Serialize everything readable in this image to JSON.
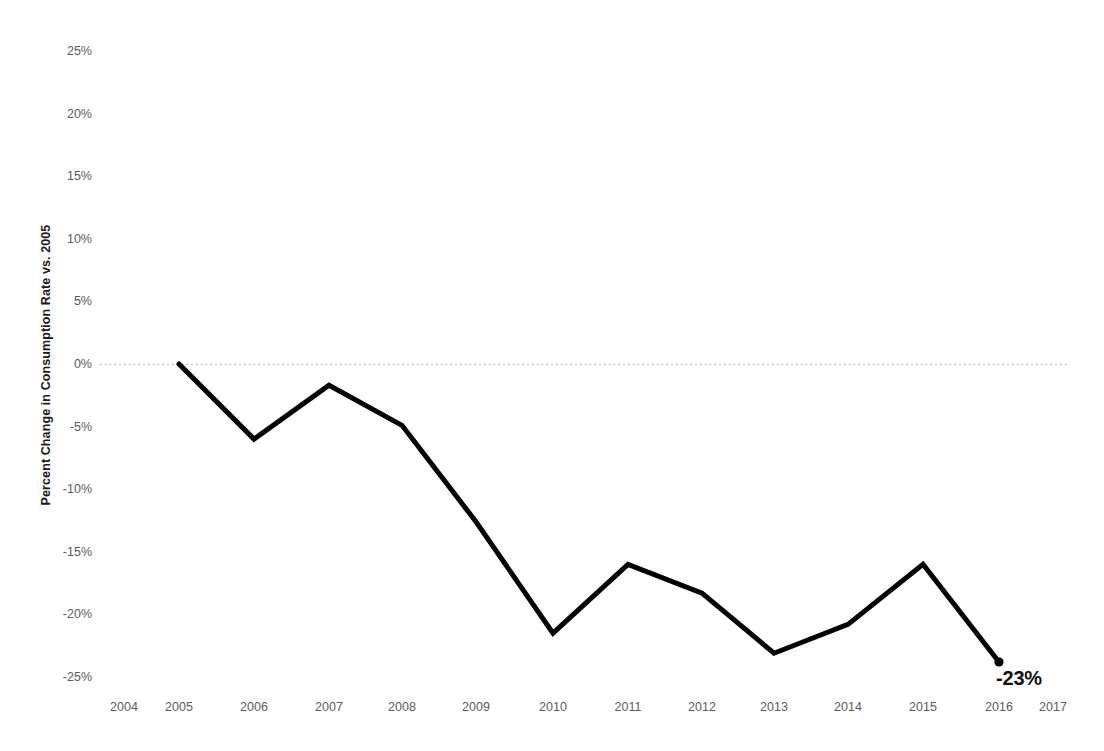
{
  "chart_data": {
    "type": "line",
    "title": "",
    "subtitle": "",
    "xlabel": "",
    "ylabel": "Percent Change in Consumption Rate vs. 2005",
    "x": [
      2005,
      2006,
      2007,
      2008,
      2009,
      2010,
      2011,
      2012,
      2013,
      2014,
      2015,
      2016
    ],
    "values": [
      0,
      -6,
      -1.7,
      -4.9,
      -12.6,
      -21.5,
      -16,
      -18.3,
      -23.1,
      -20.8,
      -16,
      -23.8
    ],
    "series": [
      {
        "name": "Percent Change in Consumption Rate vs. 2005",
        "color": "#000000",
        "values": [
          0,
          -6,
          -1.7,
          -4.9,
          -12.6,
          -21.5,
          -16,
          -18.3,
          -23.1,
          -20.8,
          -16,
          -23.8
        ]
      }
    ],
    "x_tick_labels": [
      "2004",
      "2005",
      "2006",
      "2007",
      "2008",
      "2009",
      "2010",
      "2011",
      "2012",
      "2013",
      "2014",
      "2015",
      "2016",
      "2017"
    ],
    "y_tick_labels": [
      "25%",
      "20%",
      "15%",
      "10%",
      "5%",
      "0%",
      "-5%",
      "-10%",
      "-15%",
      "-20%",
      "-25%"
    ],
    "y_tick_values": [
      25,
      20,
      15,
      10,
      5,
      0,
      -5,
      -10,
      -15,
      -20,
      -25
    ],
    "ylim": [
      -25,
      25
    ],
    "xlim": [
      2004,
      2017
    ],
    "grid": "zero-line-only",
    "gridline_at": 0,
    "gridline_style": "dotted",
    "gridline_color": "#bfbfbf",
    "legend": "none",
    "annotations": [
      {
        "name": "endpoint-value",
        "text": "-23%",
        "x": 2016,
        "y": -23.8,
        "marker": "filled-circle"
      }
    ],
    "line_color": "#000000",
    "line_width": 5,
    "background": "#ffffff",
    "tick_color": "#5b5b5b"
  },
  "axis": {
    "y_title": "Percent Change in Consumption Rate vs. 2005"
  }
}
